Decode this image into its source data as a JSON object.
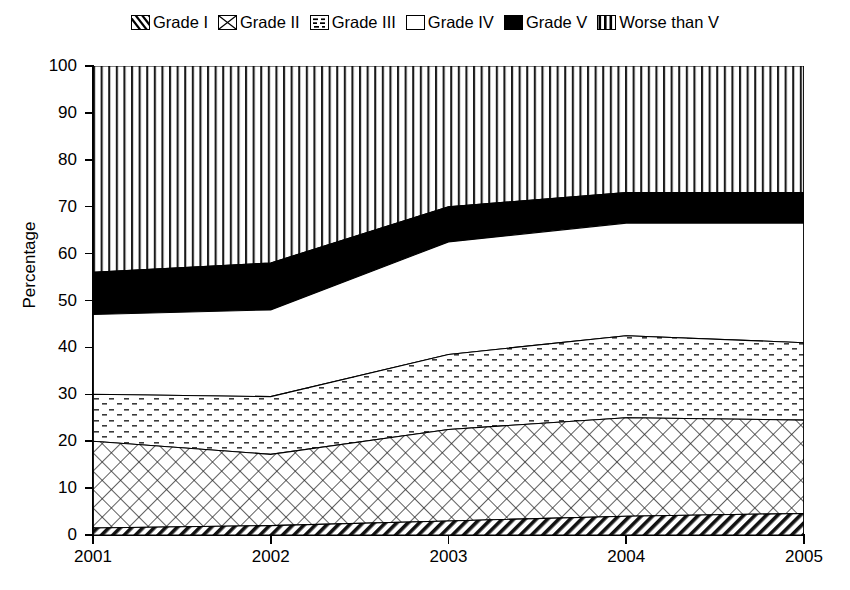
{
  "chart_data": {
    "type": "area",
    "title": "",
    "subtitle": "",
    "xlabel": "",
    "ylabel": "Percentage",
    "stacked": true,
    "grid": false,
    "legend_position": "top",
    "x": [
      2001,
      2002,
      2003,
      2004,
      2005
    ],
    "categories": [
      "2001",
      "2002",
      "2003",
      "2004",
      "2005"
    ],
    "xticklabels": [
      "2001",
      "2002",
      "2003",
      "2004",
      "2005"
    ],
    "yticklabels": [
      "0",
      "10",
      "20",
      "30",
      "40",
      "50",
      "60",
      "70",
      "80",
      "90",
      "100"
    ],
    "yticks": [
      0,
      10,
      20,
      30,
      40,
      50,
      60,
      70,
      80,
      90,
      100
    ],
    "ylim": [
      0,
      100
    ],
    "xlim": [
      2001,
      2005
    ],
    "series": [
      {
        "name": "Grade I",
        "pattern": "diagonal-hatch-dense",
        "values": [
          1.5,
          2.0,
          3.0,
          4.0,
          4.6
        ]
      },
      {
        "name": "Grade II",
        "pattern": "crosshatch-diagonal",
        "values": [
          18.5,
          15.2,
          19.5,
          21.0,
          19.9
        ]
      },
      {
        "name": "Grade III",
        "pattern": "dotted-dashes",
        "values": [
          10.0,
          12.3,
          16.0,
          17.5,
          16.5
        ]
      },
      {
        "name": "Grade IV",
        "pattern": "solid-white",
        "values": [
          17.0,
          18.5,
          24.0,
          24.0,
          25.5
        ]
      },
      {
        "name": "Grade V",
        "pattern": "solid-black",
        "values": [
          9.0,
          10.0,
          7.5,
          6.5,
          6.5
        ]
      },
      {
        "name": "Worse than V",
        "pattern": "vertical-lines",
        "values": [
          44.0,
          42.0,
          30.0,
          27.0,
          27.0
        ]
      }
    ],
    "cumulative_tops": [
      {
        "name": "Grade I",
        "values": [
          1.5,
          2.0,
          3.0,
          4.0,
          4.6
        ]
      },
      {
        "name": "Grade II",
        "values": [
          20.0,
          17.2,
          22.5,
          25.0,
          24.5
        ]
      },
      {
        "name": "Grade III",
        "values": [
          30.0,
          29.5,
          38.5,
          42.5,
          41.0
        ]
      },
      {
        "name": "Grade IV",
        "values": [
          47.0,
          48.0,
          62.5,
          66.5,
          66.5
        ]
      },
      {
        "name": "Grade V",
        "values": [
          56.0,
          58.0,
          70.0,
          73.0,
          73.0
        ]
      },
      {
        "name": "Worse than V",
        "values": [
          100.0,
          100.0,
          100.0,
          100.0,
          100.0
        ]
      }
    ]
  },
  "legend": {
    "items": [
      {
        "label": "Grade I",
        "swatch": "diagonal-hatch-dense-swatch"
      },
      {
        "label": "Grade II",
        "swatch": "crosshatch-diagonal-swatch"
      },
      {
        "label": "Grade III",
        "swatch": "dotted-dashes-swatch"
      },
      {
        "label": "Grade IV",
        "swatch": "solid-white-swatch"
      },
      {
        "label": "Grade V",
        "swatch": "solid-black-swatch"
      },
      {
        "label": "Worse than V",
        "swatch": "vertical-lines-swatch"
      }
    ]
  },
  "axes": {
    "y_title": "Percentage",
    "y_ticks": [
      "100",
      "90",
      "80",
      "70",
      "60",
      "50",
      "40",
      "30",
      "20",
      "10",
      "0"
    ],
    "x_ticks": [
      "2001",
      "2002",
      "2003",
      "2004",
      "2005"
    ]
  },
  "colors": {
    "foreground": "#000000",
    "background": "#ffffff"
  }
}
